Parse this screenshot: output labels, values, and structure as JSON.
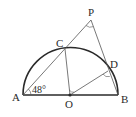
{
  "diagram": {
    "type": "geometry",
    "points": {
      "A": {
        "label": "A",
        "x": 23,
        "y": 95
      },
      "B": {
        "label": "B",
        "x": 118,
        "y": 95
      },
      "O": {
        "label": "O",
        "x": 70,
        "y": 95
      },
      "C": {
        "label": "C",
        "x": 65,
        "y": 49
      },
      "D": {
        "label": "D",
        "x": 108,
        "y": 71
      },
      "P": {
        "label": "P",
        "x": 91,
        "y": 20
      }
    },
    "angle_label": "48°",
    "colors": {
      "stroke": "#2a2a2a",
      "thin_stroke": "#555555",
      "background": "#ffffff"
    }
  }
}
